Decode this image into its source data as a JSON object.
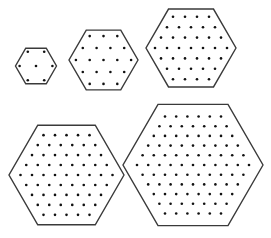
{
  "figure": {
    "width": 271,
    "height": 238,
    "outline_color": "#3a3a3a",
    "dot_color": "#111111",
    "hexagons": [
      {
        "label": "hexagon-1",
        "cx": 36,
        "cy": 66,
        "R": 20.5,
        "n": 2,
        "dot_count": 7,
        "rows": [
          2,
          3,
          2
        ]
      },
      {
        "label": "hexagon-2",
        "cx": 103.5,
        "cy": 60,
        "R": 34.5,
        "n": 3,
        "dot_count": 19,
        "rows": [
          3,
          4,
          5,
          4,
          3
        ]
      },
      {
        "label": "hexagon-3",
        "cx": 191,
        "cy": 48,
        "R": 45,
        "n": 4,
        "dot_count": 37,
        "rows": [
          4,
          5,
          6,
          7,
          6,
          5,
          4
        ]
      },
      {
        "label": "hexagon-4",
        "cx": 66.5,
        "cy": 175,
        "R": 57.5,
        "n": 5,
        "dot_count": 61,
        "rows": [
          5,
          6,
          7,
          8,
          9,
          8,
          7,
          6,
          5
        ]
      },
      {
        "label": "hexagon-5",
        "cx": 193,
        "cy": 165,
        "R": 70,
        "n": 6,
        "dot_count": 91,
        "rows": [
          6,
          7,
          8,
          9,
          10,
          11,
          10,
          9,
          8,
          7,
          6
        ]
      }
    ]
  }
}
